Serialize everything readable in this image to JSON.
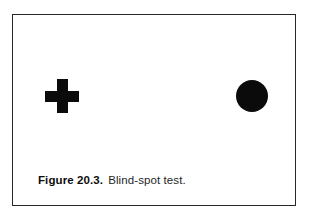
{
  "page": {
    "background_color": "#ffffff",
    "width": 310,
    "height": 219
  },
  "figure": {
    "border_color": "#272727",
    "fill_color": "#ffffff",
    "ink_color": "#0b0b0b",
    "caption": {
      "label": "Figure 20.3.",
      "text": "Blind-spot test."
    },
    "stimuli": [
      {
        "name": "cross-mark",
        "shape": "plus",
        "color": "#0b0b0b",
        "center_x": 60,
        "center_y": 94,
        "size": 34,
        "stroke": 11.5
      },
      {
        "name": "dot-mark",
        "shape": "circle",
        "color": "#0b0b0b",
        "center_x": 251,
        "center_y": 95,
        "diameter": 32
      }
    ]
  }
}
